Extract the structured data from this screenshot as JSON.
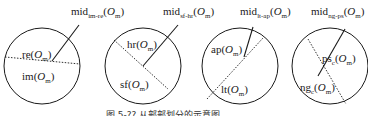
{
  "diagram": {
    "colors": {
      "stroke": "#1a1a1a",
      "background": "#ffffff"
    },
    "panels": [
      {
        "mid_label": {
          "base": "mid",
          "sub": "im-re",
          "arg": "O",
          "arg_sub": "m"
        },
        "region_a": {
          "base": "re",
          "sub": "",
          "arg": "O",
          "arg_sub": "m"
        },
        "region_b": {
          "base": "im",
          "sub": "",
          "arg": "O",
          "arg_sub": "m"
        }
      },
      {
        "mid_label": {
          "base": "mid",
          "sub": "sf-hr",
          "arg": "O",
          "arg_sub": "m"
        },
        "region_a": {
          "base": "hr",
          "sub": "",
          "arg": "O",
          "arg_sub": "m"
        },
        "region_b": {
          "base": "sf",
          "sub": "",
          "arg": "O",
          "arg_sub": "m"
        }
      },
      {
        "mid_label": {
          "base": "mid",
          "sub": "lt-ap",
          "arg": "O",
          "arg_sub": "m"
        },
        "region_a": {
          "base": "ap",
          "sub": "",
          "arg": "O",
          "arg_sub": "m"
        },
        "region_b": {
          "base": "lt",
          "sub": "",
          "arg": "O",
          "arg_sub": "m"
        }
      },
      {
        "mid_label": {
          "base": "mid",
          "sub": "ng-ps",
          "arg": "O",
          "arg_sub": "m"
        },
        "region_a": {
          "base": "ps",
          "sub": "c",
          "arg": "O",
          "arg_sub": "m"
        },
        "region_b": {
          "base": "ng",
          "sub": "c",
          "arg": "O",
          "arg_sub": "m"
        }
      }
    ],
    "caption": "图 5-?? 从部部划分的示意图",
    "paren_open": "(",
    "paren_close": ")"
  }
}
